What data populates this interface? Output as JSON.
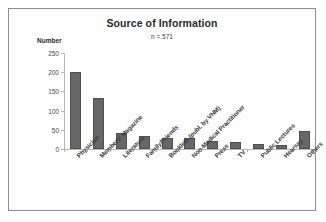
{
  "figure": {
    "border_color": "#8d8d8d",
    "background": "#ffffff"
  },
  "chart_data": {
    "type": "bar",
    "title": "Source of Information",
    "subtitle": "n = 571",
    "xlabel": "",
    "ylabel": "Number",
    "categories": [
      "Physician",
      "Members' Magazine",
      "Literature",
      "Family/Friends",
      "Booklets (publ. by VNM)",
      "Non-Medical Practitioner",
      "Press",
      "TV",
      "Public Lectures",
      "Hearsay",
      "Others"
    ],
    "values": [
      200,
      133,
      43,
      34,
      29,
      28,
      21,
      19,
      13,
      11,
      47
    ],
    "ylim": [
      0,
      250
    ],
    "yticks": [
      0,
      50,
      100,
      150,
      200,
      250
    ],
    "ytick_labels": [
      "0",
      "50",
      "100",
      "150",
      "200",
      "250"
    ],
    "grid": false,
    "legend": false,
    "bar_color": "#676767",
    "bar_edge_color": "#4f4f4f",
    "axis_color": "#b6b6b6"
  }
}
